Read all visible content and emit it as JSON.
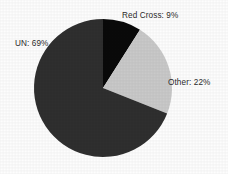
{
  "chart_data": {
    "type": "pie",
    "title": "",
    "subtitle": "",
    "xlabel": "",
    "ylabel": "",
    "legend_position": "none",
    "grid": false,
    "labels_inline": true,
    "start_angle_deg": 0,
    "direction": "clockwise",
    "categories": [
      "Red Cross",
      "Other",
      "UN"
    ],
    "values": [
      9,
      22,
      69
    ],
    "value_unit": "%",
    "slices": [
      {
        "name": "Red Cross",
        "value": 9,
        "label": "Red Cross: 9%",
        "color": "#0a0a0a",
        "start_deg": 0,
        "end_deg": 32.4
      },
      {
        "name": "Other",
        "value": 22,
        "label": "Other: 22%",
        "color": "#c9c9c9",
        "start_deg": 32.4,
        "end_deg": 111.6
      },
      {
        "name": "UN",
        "value": 69,
        "label": "UN: 69%",
        "color": "#2f2f2f",
        "start_deg": 111.6,
        "end_deg": 360
      }
    ]
  },
  "labels": {
    "red_cross": "Red Cross: 9%",
    "other": "Other: 22%",
    "un": "UN: 69%"
  },
  "colors": {
    "background": "#fdfdfd",
    "red_cross_slice": "#0a0a0a",
    "other_slice": "#c9c9c9",
    "un_slice": "#2f2f2f",
    "label_text": "#2b2b2b"
  },
  "geometry": {
    "center_x": 103,
    "center_y": 88,
    "radius": 69
  }
}
